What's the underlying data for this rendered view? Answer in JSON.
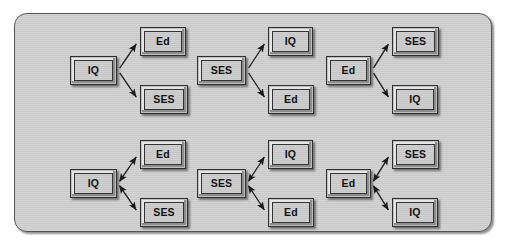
{
  "figure": {
    "background_color": "#ffffff",
    "panel_color": "#c9c9c9",
    "panel_border_color": "#545454",
    "node_fill_color": "#bfbfbf",
    "node_border_color": "#2f2f2f",
    "arrow_color": "#1a1a1a"
  },
  "groups": [
    {
      "id": "group-1",
      "row": "top",
      "column": 1,
      "arrow_style": "unidirectional",
      "source": {
        "label": "IQ",
        "x": 70,
        "y": 56,
        "w": 47,
        "h": 29
      },
      "targets": [
        {
          "label": "Ed",
          "x": 140,
          "y": 27,
          "w": 46,
          "h": 29
        },
        {
          "label": "SES",
          "x": 140,
          "y": 85,
          "w": 48,
          "h": 29
        }
      ],
      "edges": [
        {
          "from": "IQ",
          "to": "Ed",
          "direction": "forward"
        },
        {
          "from": "IQ",
          "to": "SES",
          "direction": "forward"
        }
      ]
    },
    {
      "id": "group-2",
      "row": "top",
      "column": 2,
      "arrow_style": "unidirectional",
      "source": {
        "label": "SES",
        "x": 197,
        "y": 56,
        "w": 49,
        "h": 29
      },
      "targets": [
        {
          "label": "IQ",
          "x": 268,
          "y": 27,
          "w": 45,
          "h": 29
        },
        {
          "label": "Ed",
          "x": 268,
          "y": 85,
          "w": 46,
          "h": 29
        }
      ],
      "edges": [
        {
          "from": "SES",
          "to": "IQ",
          "direction": "forward"
        },
        {
          "from": "SES",
          "to": "Ed",
          "direction": "forward"
        }
      ]
    },
    {
      "id": "group-3",
      "row": "top",
      "column": 3,
      "arrow_style": "unidirectional",
      "source": {
        "label": "Ed",
        "x": 326,
        "y": 56,
        "w": 45,
        "h": 29
      },
      "targets": [
        {
          "label": "SES",
          "x": 392,
          "y": 27,
          "w": 47,
          "h": 29
        },
        {
          "label": "IQ",
          "x": 392,
          "y": 85,
          "w": 46,
          "h": 29
        }
      ],
      "edges": [
        {
          "from": "Ed",
          "to": "SES",
          "direction": "forward"
        },
        {
          "from": "Ed",
          "to": "IQ",
          "direction": "forward"
        }
      ]
    },
    {
      "id": "group-4",
      "row": "bottom",
      "column": 1,
      "arrow_style": "bidirectional",
      "source": {
        "label": "IQ",
        "x": 70,
        "y": 169,
        "w": 47,
        "h": 29
      },
      "targets": [
        {
          "label": "Ed",
          "x": 140,
          "y": 140,
          "w": 46,
          "h": 29
        },
        {
          "label": "SES",
          "x": 140,
          "y": 198,
          "w": 48,
          "h": 29
        }
      ],
      "edges": [
        {
          "from": "IQ",
          "to": "Ed",
          "direction": "both"
        },
        {
          "from": "IQ",
          "to": "SES",
          "direction": "both"
        }
      ]
    },
    {
      "id": "group-5",
      "row": "bottom",
      "column": 2,
      "arrow_style": "bidirectional",
      "source": {
        "label": "SES",
        "x": 197,
        "y": 169,
        "w": 49,
        "h": 29
      },
      "targets": [
        {
          "label": "IQ",
          "x": 268,
          "y": 140,
          "w": 45,
          "h": 29
        },
        {
          "label": "Ed",
          "x": 268,
          "y": 198,
          "w": 46,
          "h": 29
        }
      ],
      "edges": [
        {
          "from": "SES",
          "to": "IQ",
          "direction": "both"
        },
        {
          "from": "SES",
          "to": "Ed",
          "direction": "both"
        }
      ]
    },
    {
      "id": "group-6",
      "row": "bottom",
      "column": 3,
      "arrow_style": "bidirectional",
      "source": {
        "label": "Ed",
        "x": 326,
        "y": 169,
        "w": 45,
        "h": 29
      },
      "targets": [
        {
          "label": "SES",
          "x": 392,
          "y": 140,
          "w": 47,
          "h": 29
        },
        {
          "label": "IQ",
          "x": 392,
          "y": 198,
          "w": 46,
          "h": 29
        }
      ],
      "edges": [
        {
          "from": "Ed",
          "to": "SES",
          "direction": "both"
        },
        {
          "from": "Ed",
          "to": "IQ",
          "direction": "both"
        }
      ]
    }
  ]
}
